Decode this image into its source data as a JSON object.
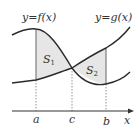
{
  "diagram": {
    "curve_f_label": "y=f(x)",
    "curve_g_label": "y=g(x)",
    "region1_label": "S",
    "region1_sub": "1",
    "region2_label": "S",
    "region2_sub": "2",
    "axis_label": "x",
    "ticks": [
      "a",
      "c",
      "b"
    ],
    "colors": {
      "curve": "#2a2a2a",
      "fill": "#e6e6e6",
      "axis": "#333333",
      "dashed": "#777777"
    }
  }
}
